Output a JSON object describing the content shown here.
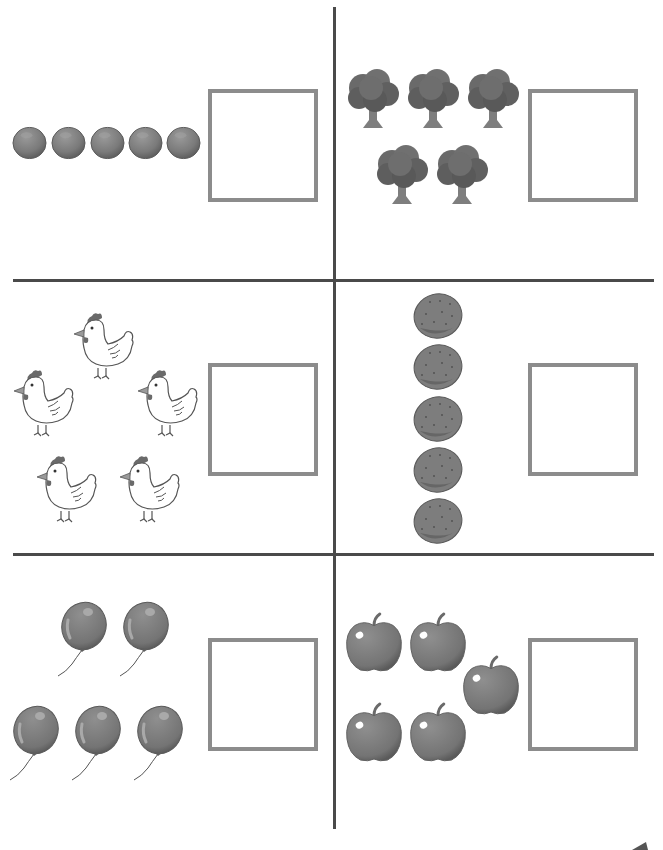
{
  "worksheet": {
    "type": "count-and-write",
    "layout": {
      "rows": 3,
      "cols": 2
    },
    "colors": {
      "divider": "#4a4a4a",
      "box_border": "#8c8c8c",
      "object_fill": "#7a7a7a",
      "object_dark": "#5e5e5e",
      "background": "#ffffff"
    },
    "cells": [
      {
        "id": "stones",
        "object": "stone-icon",
        "count": 5,
        "answer": ""
      },
      {
        "id": "trees",
        "object": "tree-icon",
        "count": 5,
        "answer": ""
      },
      {
        "id": "chickens",
        "object": "chicken-icon",
        "count": 5,
        "answer": ""
      },
      {
        "id": "potatoes",
        "object": "potato-icon",
        "count": 5,
        "answer": ""
      },
      {
        "id": "balloons",
        "object": "balloon-icon",
        "count": 5,
        "answer": ""
      },
      {
        "id": "apples",
        "object": "apple-icon",
        "count": 5,
        "answer": ""
      }
    ]
  }
}
